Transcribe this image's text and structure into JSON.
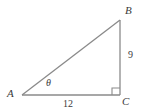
{
  "figure": {
    "type": "right-triangle-diagram",
    "background_color": "#ffffff",
    "stroke_color": "#8a8a8a",
    "text_color": "#3b3b3b",
    "vertices": {
      "A": {
        "label": "A",
        "x": 22,
        "y": 95
      },
      "B": {
        "label": "B",
        "x": 120,
        "y": 20
      },
      "C": {
        "label": "C",
        "x": 120,
        "y": 95
      }
    },
    "angle_marks": {
      "theta": {
        "label": "θ",
        "at_vertex": "A"
      },
      "right_angle": {
        "label": "",
        "at_vertex": "C",
        "size": 7
      }
    },
    "side_labels": {
      "base": {
        "text": "12",
        "between": "A-C"
      },
      "vertical": {
        "text": "9",
        "between": "B-C"
      },
      "hypotenuse": {
        "text": "",
        "between": "A-B"
      }
    }
  }
}
